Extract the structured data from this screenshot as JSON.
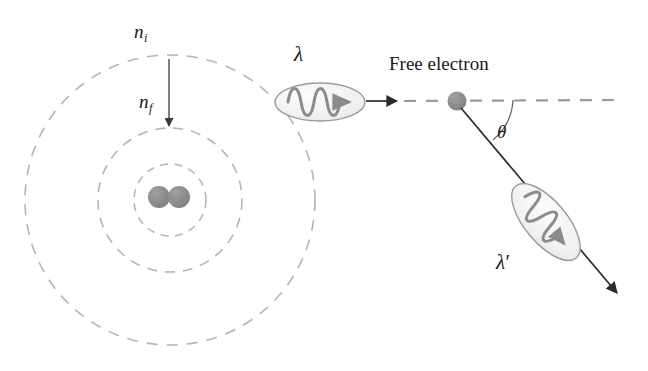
{
  "figure": {
    "background_color": "#ffffff",
    "width": 648,
    "height": 371
  },
  "colors": {
    "orbit_dashed": "#b9b2b6",
    "nucleus_fill": "#8a8a8a",
    "photon_ellipse_fill": "#f0f0f0",
    "photon_ellipse_stroke": "#9a9a9a",
    "wave_stroke": "#8b8b8b",
    "ray_stroke": "#2b2b2b",
    "dashed_axis": "#9a9a9a",
    "electron_fill": "#8a8a8a",
    "text": "#1a1a1a",
    "arc_stroke": "#6b6b6b"
  },
  "atom": {
    "name": "atom-with-electron-shells",
    "center": {
      "x": 170,
      "y": 200
    },
    "shells": [
      {
        "name": "inner-shell",
        "radius": 36
      },
      {
        "name": "middle-shell",
        "radius": 72
      },
      {
        "name": "outer-shell",
        "radius": 145
      }
    ],
    "nucleus": {
      "particles": [
        {
          "cx": 159,
          "cy": 197,
          "r": 11
        },
        {
          "cx": 179,
          "cy": 197,
          "r": 11
        }
      ]
    },
    "transition_arrow": {
      "name": "electron-transition-arrow",
      "from": {
        "x": 169,
        "y": 59
      },
      "to": {
        "x": 169,
        "y": 128
      },
      "direction": "downward"
    }
  },
  "labels": {
    "n_initial": {
      "base": "n",
      "subscript": "i"
    },
    "n_final": {
      "base": "n",
      "subscript": "f"
    },
    "lambda_incident": "λ",
    "lambda_scattered": {
      "base": "λ",
      "prime": "′"
    },
    "theta": "θ",
    "free_electron": "Free electron"
  },
  "incident_photon": {
    "name": "incident-photon",
    "ellipse": {
      "cx": 320,
      "cy": 102,
      "rx": 45,
      "ry": 19,
      "rotation": 0
    },
    "wave_cycles": 3,
    "arrow_tip": {
      "x": 398,
      "y": 101
    },
    "travel_direction": "left-to-right"
  },
  "scattered_photon": {
    "name": "scattered-photon",
    "ellipse": {
      "cx": 546,
      "cy": 222,
      "rx": 46,
      "ry": 21,
      "rotation": 52
    },
    "wave_cycles": 3,
    "arrow_tip": {
      "x": 620,
      "y": 296
    },
    "travel_direction": "down-right"
  },
  "free_electron": {
    "name": "free-electron-dot",
    "center": {
      "x": 457,
      "y": 101
    },
    "radius": 9
  },
  "axis": {
    "name": "incident-direction-axis",
    "from": {
      "x": 398,
      "y": 101
    },
    "to": {
      "x": 618,
      "y": 100
    },
    "style": "dashed"
  },
  "scatter_ray": {
    "name": "scattered-ray-line",
    "from": {
      "x": 461,
      "y": 108
    },
    "to": {
      "x": 620,
      "y": 296
    }
  },
  "angle_arc": {
    "name": "scattering-angle-arc",
    "vertex": {
      "x": 457,
      "y": 101
    },
    "radius": 56,
    "start_angle_deg": 0,
    "end_angle_deg": 50,
    "label": "θ"
  }
}
